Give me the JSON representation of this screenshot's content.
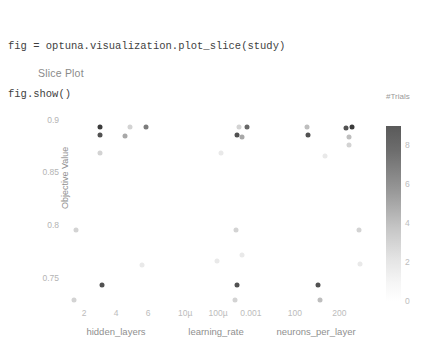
{
  "code": {
    "lines": [
      "fig = optuna.visualization.plot_slice(study)",
      "fig.show()"
    ]
  },
  "figure": {
    "title": "Slice Plot",
    "colorbar": {
      "title": "#Trials",
      "ticks": [
        "8",
        "6",
        "4",
        "2",
        "0"
      ],
      "tick_values": [
        8,
        6,
        4,
        2,
        0
      ],
      "range": [
        0,
        9
      ],
      "colorscale_low": "#ffffff",
      "colorscale_high": "#4a4a4a"
    }
  },
  "chart_data": {
    "type": "scatter",
    "title": "Slice Plot",
    "ylabel": "Objective Value",
    "ylim": [
      0.725,
      0.915
    ],
    "ytick_labels": [
      "0.9",
      "0.85",
      "0.8",
      "0.75"
    ],
    "ytick_values": [
      0.9,
      0.85,
      0.8,
      0.75
    ],
    "grid": false,
    "legend": "colorbar-right",
    "color_label": "#Trials",
    "panels": [
      {
        "xlabel": "hidden_layers",
        "xscale": "linear",
        "xlim": [
          1,
          7
        ],
        "xtick_labels": [
          "2",
          "4",
          "6"
        ],
        "xtick_values": [
          2,
          4,
          6
        ],
        "points": [
          {
            "x": 3,
            "y": 0.893,
            "trial": 9
          },
          {
            "x": 3,
            "y": 0.886,
            "trial": 8
          },
          {
            "x": 3,
            "y": 0.868,
            "trial": 2
          },
          {
            "x": 4.9,
            "y": 0.893,
            "trial": 2
          },
          {
            "x": 5.9,
            "y": 0.893,
            "trial": 6
          },
          {
            "x": 4.55,
            "y": 0.885,
            "trial": 4
          },
          {
            "x": 1.5,
            "y": 0.795,
            "trial": 2
          },
          {
            "x": 5.6,
            "y": 0.762,
            "trial": 1
          },
          {
            "x": 3.1,
            "y": 0.743,
            "trial": 8
          },
          {
            "x": 1.4,
            "y": 0.729,
            "trial": 2
          }
        ]
      },
      {
        "xlabel": "learning_rate",
        "xscale": "log",
        "xlim": [
          3e-06,
          0.0025
        ],
        "xtick_labels": [
          "10µ",
          "100µ",
          "0.001"
        ],
        "xtick_values": [
          1e-05,
          0.0001,
          0.001
        ],
        "points": [
          {
            "x": 0.00075,
            "y": 0.893,
            "trial": 7
          },
          {
            "x": 0.00042,
            "y": 0.893,
            "trial": 2
          },
          {
            "x": 0.00039,
            "y": 0.886,
            "trial": 8
          },
          {
            "x": 0.00055,
            "y": 0.884,
            "trial": 4
          },
          {
            "x": 0.00012,
            "y": 0.868,
            "trial": 1
          },
          {
            "x": 0.00034,
            "y": 0.795,
            "trial": 2
          },
          {
            "x": 9e-05,
            "y": 0.766,
            "trial": 1
          },
          {
            "x": 0.00055,
            "y": 0.772,
            "trial": 1
          },
          {
            "x": 0.00038,
            "y": 0.743,
            "trial": 8
          },
          {
            "x": 0.00033,
            "y": 0.729,
            "trial": 2
          }
        ]
      },
      {
        "xlabel": "neurons_per_layer",
        "xscale": "linear",
        "xlim": [
          40,
          255
        ],
        "xtick_labels": [
          "100",
          "200"
        ],
        "xtick_values": [
          100,
          200
        ],
        "points": [
          {
            "x": 128,
            "y": 0.893,
            "trial": 3
          },
          {
            "x": 214,
            "y": 0.892,
            "trial": 8
          },
          {
            "x": 229,
            "y": 0.893,
            "trial": 9
          },
          {
            "x": 130,
            "y": 0.886,
            "trial": 8
          },
          {
            "x": 221,
            "y": 0.884,
            "trial": 3
          },
          {
            "x": 222,
            "y": 0.876,
            "trial": 2
          },
          {
            "x": 168,
            "y": 0.866,
            "trial": 1
          },
          {
            "x": 243,
            "y": 0.795,
            "trial": 2
          },
          {
            "x": 246,
            "y": 0.763,
            "trial": 1
          },
          {
            "x": 152,
            "y": 0.743,
            "trial": 8
          },
          {
            "x": 156,
            "y": 0.729,
            "trial": 3
          }
        ]
      }
    ]
  }
}
